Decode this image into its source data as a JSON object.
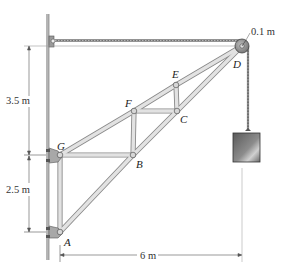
{
  "figure": {
    "type": "truss-with-pulley",
    "joints": [
      {
        "id": "A",
        "label": "A",
        "x": 60,
        "y": 232
      },
      {
        "id": "B",
        "label": "B",
        "x": 133,
        "y": 155
      },
      {
        "id": "C",
        "label": "C",
        "x": 177,
        "y": 111
      },
      {
        "id": "D",
        "label": "D",
        "x": 242,
        "y": 46
      },
      {
        "id": "E",
        "label": "E",
        "x": 176,
        "y": 85
      },
      {
        "id": "F",
        "label": "F",
        "x": 134,
        "y": 111
      },
      {
        "id": "G",
        "label": "G",
        "x": 60,
        "y": 155
      }
    ],
    "members": [
      [
        "A",
        "G"
      ],
      [
        "A",
        "B"
      ],
      [
        "G",
        "B"
      ],
      [
        "G",
        "F"
      ],
      [
        "B",
        "F"
      ],
      [
        "B",
        "C"
      ],
      [
        "F",
        "C"
      ],
      [
        "F",
        "E"
      ],
      [
        "E",
        "C"
      ],
      [
        "E",
        "D"
      ],
      [
        "C",
        "D"
      ]
    ],
    "pulley": {
      "label": "0.1 m",
      "radius_label": "0.1 m"
    },
    "load": {
      "shape": "block"
    }
  },
  "dimensions": {
    "upper_vertical": "3.5 m",
    "lower_vertical": "2.5 m",
    "horizontal": "6 m"
  },
  "labels": {
    "A": "A",
    "B": "B",
    "C": "C",
    "D": "D",
    "E": "E",
    "F": "F",
    "G": "G",
    "pulley_radius": "0.1 m"
  },
  "colors": {
    "member_fill": "#d9d9d9",
    "member_edge": "#8a8a8a",
    "wall": "#b8b8b8",
    "cable": "#6a6a6a",
    "block_dark": "#4a4a4a",
    "block_light": "#c8c8c8"
  }
}
